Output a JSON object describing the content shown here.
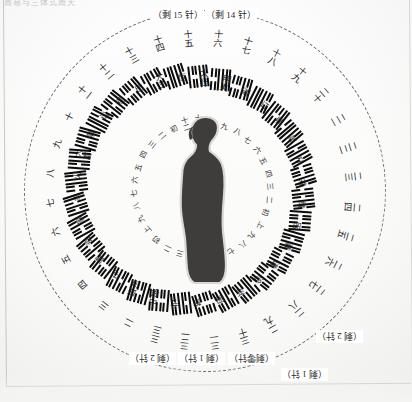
{
  "page": {
    "top_caption": "周易与三体式周天",
    "figure_name": "human-silhouette-profile",
    "ring_style": "dashed"
  },
  "callouts": [
    {
      "text": "（剩 15 针）",
      "name": "callout-remaining-15",
      "flip": false,
      "left": 152,
      "top": 8
    },
    {
      "text": "（剩 14 针）",
      "name": "callout-remaining-14",
      "flip": false,
      "left": 205,
      "top": 8
    },
    {
      "text": "（剩 2 针）",
      "name": "callout-remaining-2",
      "flip": true,
      "left": 129,
      "top": 352
    },
    {
      "text": "（剩 1 针）",
      "name": "callout-remaining-1",
      "flip": true,
      "left": 178,
      "top": 352
    },
    {
      "text": "（剩零针）",
      "name": "callout-remaining-zero",
      "flip": true,
      "left": 228,
      "top": 352
    },
    {
      "text": "（剩 1 针）",
      "name": "callout-remaining-1-b",
      "flip": true,
      "left": 281,
      "top": 368
    },
    {
      "text": "（剩 2 针）",
      "name": "callout-remaining-2-b",
      "flip": true,
      "left": 316,
      "top": 330
    }
  ],
  "wheel": {
    "count": 32,
    "outer_numbers": [
      "十四",
      "十五",
      "十六",
      "十七",
      "十八",
      "十九",
      "二十",
      "二一",
      "二二",
      "二三",
      "二四",
      "二五",
      "二六",
      "二七",
      "二八",
      "二九",
      "三十",
      "三一",
      "三二",
      "三三",
      "二",
      "三",
      "四",
      "五",
      "六",
      "七",
      "八",
      "九",
      "十",
      "十一",
      "十二",
      "十三"
    ],
    "hexagram_names": [
      "大过",
      "恒",
      "大壮",
      "明夷",
      "遁",
      "订",
      "鼎",
      "革",
      "升",
      "井",
      "贲",
      "困",
      "蒹",
      "谦",
      "追",
      "渐",
      "羽",
      "旅",
      "节",
      "中孚",
      "既济",
      "屯",
      "蒙",
      "资",
      "家",
      "丰",
      "火",
      "大畜",
      "需",
      "讼",
      "观",
      "比"
    ],
    "hexagram_lines": [
      [
        0,
        1,
        1,
        1,
        1,
        0
      ],
      [
        0,
        1,
        1,
        0,
        0,
        1
      ],
      [
        1,
        1,
        1,
        1,
        0,
        0
      ],
      [
        1,
        0,
        1,
        0,
        0,
        0
      ],
      [
        0,
        0,
        1,
        1,
        1,
        1
      ],
      [
        1,
        1,
        0,
        0,
        1,
        1
      ],
      [
        1,
        0,
        1,
        1,
        1,
        0
      ],
      [
        1,
        0,
        1,
        1,
        0,
        1
      ],
      [
        0,
        1,
        1,
        0,
        0,
        0
      ],
      [
        0,
        1,
        1,
        0,
        1,
        0
      ],
      [
        1,
        0,
        0,
        0,
        0,
        1
      ],
      [
        0,
        1,
        1,
        0,
        1,
        1
      ],
      [
        0,
        0,
        1,
        0,
        0,
        0
      ],
      [
        0,
        0,
        1,
        0,
        0,
        0
      ],
      [
        0,
        0,
        0,
        1,
        1,
        0
      ],
      [
        0,
        0,
        1,
        1,
        0,
        1
      ],
      [
        1,
        0,
        0,
        0,
        0,
        0
      ],
      [
        1,
        0,
        1,
        1,
        0,
        1
      ],
      [
        0,
        1,
        0,
        0,
        0,
        1
      ],
      [
        1,
        1,
        0,
        0,
        1,
        1
      ],
      [
        1,
        0,
        1,
        0,
        1,
        0
      ],
      [
        0,
        1,
        0,
        0,
        0,
        1
      ],
      [
        1,
        0,
        0,
        0,
        1,
        0
      ],
      [
        1,
        0,
        1,
        0,
        0,
        1
      ],
      [
        1,
        1,
        0,
        1,
        0,
        1
      ],
      [
        1,
        0,
        1,
        1,
        0,
        0
      ],
      [
        1,
        0,
        1,
        1,
        0,
        1
      ],
      [
        1,
        1,
        1,
        0,
        0,
        1
      ],
      [
        0,
        1,
        0,
        1,
        1,
        1
      ],
      [
        1,
        1,
        1,
        0,
        1,
        0
      ],
      [
        1,
        1,
        0,
        0,
        0,
        0
      ],
      [
        0,
        0,
        0,
        0,
        1,
        0
      ]
    ],
    "inner_labels": [
      "十二",
      "十一",
      "十",
      "九",
      "八",
      "七",
      "六",
      "五",
      "四",
      "三",
      "二",
      "初",
      "上",
      "九",
      "八",
      "七",
      "六",
      "五",
      "四",
      "三",
      "二",
      "初",
      "上",
      "九",
      "八",
      "七",
      "六",
      "五",
      "四",
      "三",
      "二",
      "初"
    ]
  }
}
